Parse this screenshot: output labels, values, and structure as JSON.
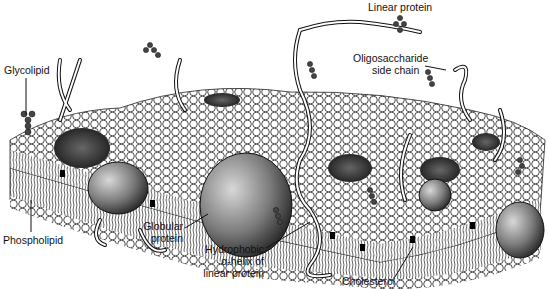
{
  "diagram": {
    "labels": {
      "linear_protein": "Linear protein",
      "glycolipid": "Glycolipid",
      "oligosaccharide_line1": "Oligosaccharide",
      "oligosaccharide_line2": "side chain",
      "phospholipid": "Phospholipid",
      "globular_line1": "Globular",
      "globular_line2": "protein",
      "hydrophobic_line1": "Hydrophobic",
      "hydrophobic_line2": "α-helix of",
      "hydrophobic_line3": "linear protein",
      "cholesterol": "Cholesterol"
    },
    "colors": {
      "background": "#ffffff",
      "ink": "#111111",
      "head_fill": "#ffffff",
      "protein_dark": "#3a3a3a",
      "protein_light": "#bdbdbd",
      "cholesterol": "#000000"
    }
  }
}
